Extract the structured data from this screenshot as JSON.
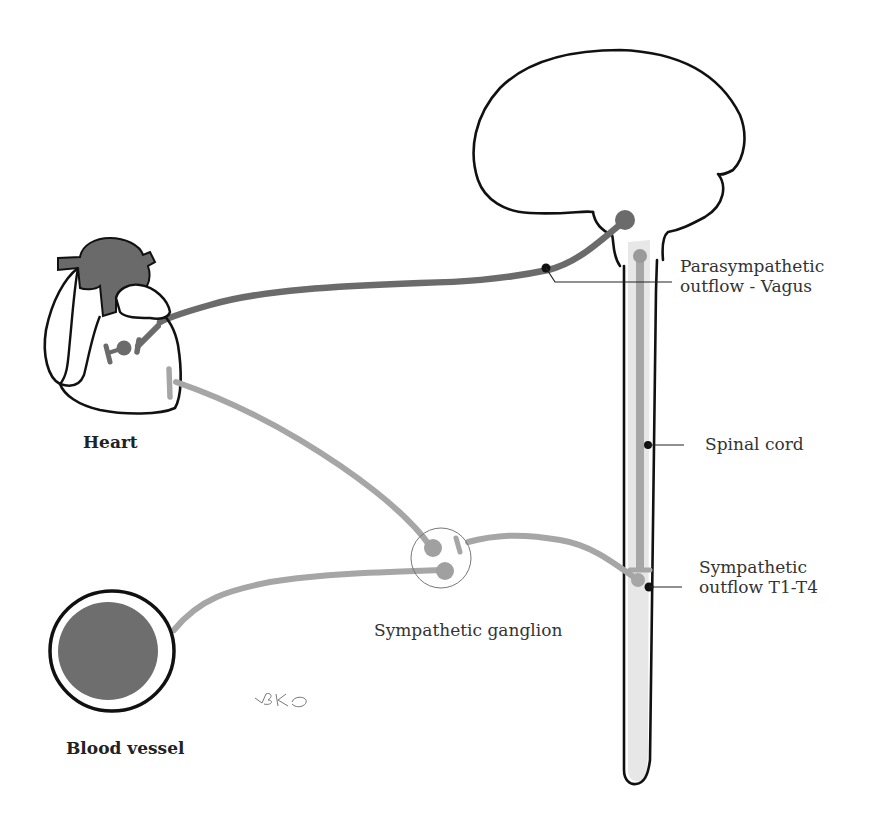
{
  "diagram": {
    "type": "autonomic-innervation",
    "colors": {
      "parasympathetic": "#6b6b6b",
      "sympathetic": "#a8a8a8",
      "outline": "#111111",
      "vessel_lumen": "#6e6e6e",
      "heart_vessels": "#6a6a6a",
      "spinal_canal": "#e4e4e4"
    },
    "labels": {
      "heart": "Heart",
      "blood_vessel": "Blood vessel",
      "parasympathetic_line1": "Parasympathetic",
      "parasympathetic_line2": "outflow - Vagus",
      "spinal_cord": "Spinal cord",
      "sympathetic_outflow_line1": "Sympathetic",
      "sympathetic_outflow_line2": "outflow T1-T4",
      "sympathetic_ganglion": "Sympathetic ganglion",
      "signature": "BK"
    },
    "nodes": [
      {
        "id": "brain",
        "label": ""
      },
      {
        "id": "spinal-cord",
        "label": "Spinal cord"
      },
      {
        "id": "heart",
        "label": "Heart"
      },
      {
        "id": "blood-vessel",
        "label": "Blood vessel"
      },
      {
        "id": "sympathetic-ganglion",
        "label": "Sympathetic ganglion"
      }
    ],
    "edges": [
      {
        "from": "brain",
        "to": "heart",
        "label": "Parasympathetic outflow - Vagus",
        "style": "dark"
      },
      {
        "from": "spinal-cord",
        "to": "sympathetic-ganglion",
        "label": "Sympathetic outflow T1-T4",
        "style": "light"
      },
      {
        "from": "sympathetic-ganglion",
        "to": "heart",
        "label": "",
        "style": "light"
      },
      {
        "from": "sympathetic-ganglion",
        "to": "blood-vessel",
        "label": "",
        "style": "light"
      }
    ]
  }
}
